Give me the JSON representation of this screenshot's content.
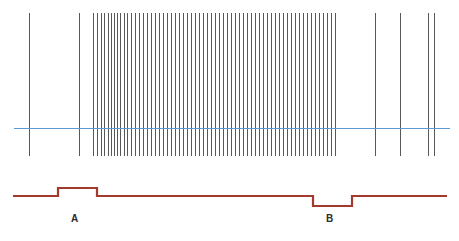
{
  "figure": {
    "width": 459,
    "height": 241,
    "background": "#ffffff"
  },
  "colors": {
    "spike": "#58585a",
    "threshold": "#5b9bd5",
    "rate_trace": "#a33a2e",
    "label_text": "#2b2b2b"
  },
  "annotations": [
    {
      "id": "a",
      "label": "A",
      "x": 71,
      "y": 214
    },
    {
      "id": "b",
      "label": "B",
      "x": 326,
      "y": 214
    }
  ],
  "chart_data": {
    "type": "line",
    "title": "",
    "subtitle": "",
    "xlabel": "",
    "ylabel": "",
    "grid": false,
    "legend": null,
    "panels": [
      {
        "name": "spike-raster",
        "type": "raster",
        "y_top": 13,
        "y_bottom": 156,
        "description": "Vertical spike events; sparse at edges, dense high-frequency burst in the middle",
        "spike_times": [
          29,
          79,
          93,
          97,
          101,
          104,
          108,
          111,
          114,
          117,
          120,
          124,
          127,
          131,
          135,
          139,
          143,
          147,
          151,
          155,
          159,
          163,
          167,
          171,
          175,
          179,
          183,
          187,
          191,
          195,
          199,
          203,
          207,
          211,
          215,
          219,
          223,
          227,
          231,
          235,
          239,
          243,
          247,
          251,
          255,
          259,
          263,
          267,
          271,
          275,
          279,
          283,
          287,
          291,
          295,
          299,
          303,
          307,
          311,
          315,
          319,
          323,
          327,
          331,
          335,
          375,
          400,
          428,
          434
        ],
        "threshold": {
          "name": "baseline-threshold",
          "y": 128,
          "x_start": 14,
          "x_end": 450,
          "color": "#5b9bd5"
        }
      },
      {
        "name": "rate-trace",
        "type": "step",
        "description": "Step waveform: baseline with an upward step at A and a downward step at B",
        "baseline_y": 196,
        "high_y": 188,
        "low_y": 206,
        "x_start": 13,
        "x_end": 447,
        "steps": [
          {
            "x": 13,
            "y": 196,
            "state": "baseline"
          },
          {
            "x": 58,
            "y": 196,
            "state": "baseline"
          },
          {
            "x": 58,
            "y": 188,
            "state": "high"
          },
          {
            "x": 97,
            "y": 188,
            "state": "high"
          },
          {
            "x": 97,
            "y": 196,
            "state": "baseline"
          },
          {
            "x": 313,
            "y": 196,
            "state": "baseline"
          },
          {
            "x": 313,
            "y": 206,
            "state": "low"
          },
          {
            "x": 352,
            "y": 206,
            "state": "low"
          },
          {
            "x": 352,
            "y": 196,
            "state": "baseline"
          },
          {
            "x": 447,
            "y": 196,
            "state": "baseline"
          }
        ]
      }
    ]
  }
}
